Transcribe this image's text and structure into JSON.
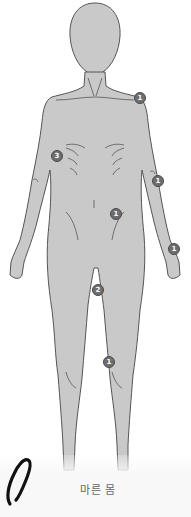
{
  "figure": {
    "caption": "마른 몸",
    "body_fill": "#c8c8c8",
    "outline": "#555555",
    "marker_fill": "#6e6e6e",
    "markers": [
      {
        "label": "1",
        "region": "shoulder-right",
        "x": 139,
        "y": 95
      },
      {
        "label": "3",
        "region": "ribs-left",
        "x": 55,
        "y": 154
      },
      {
        "label": "1",
        "region": "elbow-right",
        "x": 154,
        "y": 175
      },
      {
        "label": "1",
        "region": "hip-right",
        "x": 111,
        "y": 210
      },
      {
        "label": "1",
        "region": "wrist-right",
        "x": 169,
        "y": 244
      },
      {
        "label": "2",
        "region": "inner-thigh",
        "x": 93,
        "y": 285
      },
      {
        "label": "1",
        "region": "knee-right",
        "x": 104,
        "y": 359
      }
    ]
  },
  "icons": {
    "clip": "paperclip-icon"
  }
}
